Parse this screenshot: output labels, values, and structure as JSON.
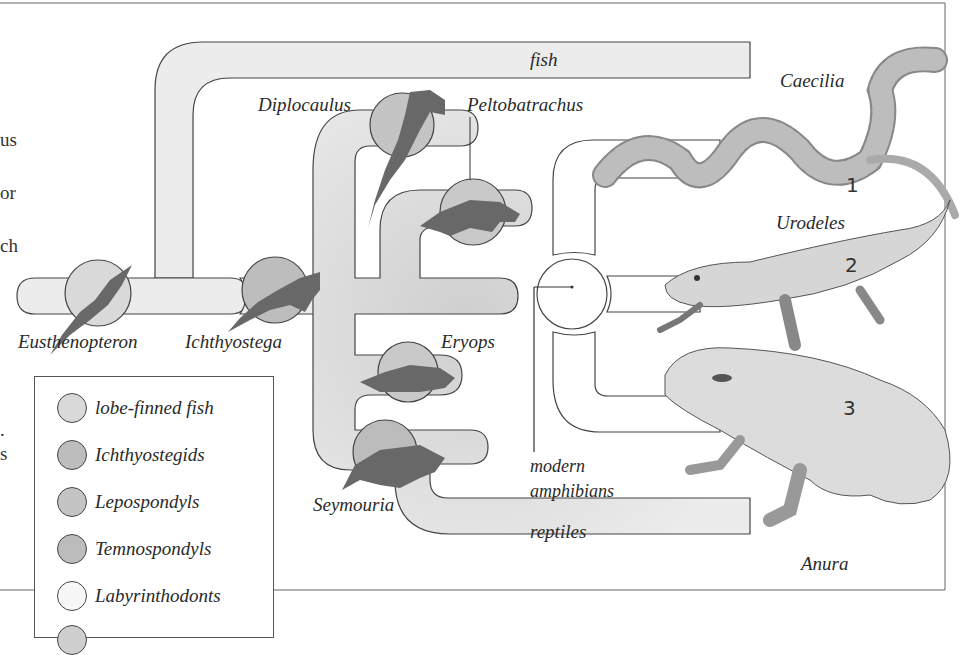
{
  "diagram": {
    "type": "phylogenetic-tree",
    "margin_text": [
      "us",
      "or",
      "ch",
      ".",
      "s"
    ],
    "branches": {
      "fish": "fish",
      "reptiles": "reptiles",
      "modern_amphibians_line1": "modern",
      "modern_amphibians_line2": "amphibians"
    },
    "taxa": {
      "eusthenopteron": "Eusthenopteron",
      "ichthyostega": "Ichthyostega",
      "diplocaulus": "Diplocaulus",
      "peltobatrachus": "Peltobatrachus",
      "eryops": "Eryops",
      "seymouria": "Seymouria",
      "caecilia": "Caecilia",
      "urodeles": "Urodeles",
      "anura": "Anura"
    },
    "numbers": {
      "caecilia": "1",
      "urodeles": "2",
      "anura": "3"
    }
  },
  "legend": {
    "items": [
      {
        "label": "lobe-finned fish",
        "color": "#d9d9d9"
      },
      {
        "label": "Ichthyostegids",
        "color": "#bdbdbd"
      },
      {
        "label": "Lepospondyls",
        "color": "#c4c4c4"
      },
      {
        "label": "Temnospondyls",
        "color": "#bcbcbc"
      },
      {
        "label": "Labyrinthodonts",
        "color": "#f7f7f7"
      }
    ]
  },
  "colors": {
    "tube_fill": "#ececec",
    "tube_stroke": "#444444",
    "silhouette": "#6b6b6b",
    "circle_fill": "#c9c9c9"
  }
}
